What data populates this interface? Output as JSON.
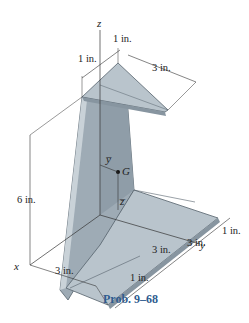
{
  "figure": {
    "caption": "Prob. 9–68",
    "axes": {
      "x": "x",
      "y": "y",
      "z": "z"
    },
    "centroid": {
      "label": "G",
      "ybar": "y̅",
      "zbar": "z̅"
    },
    "dimensions": {
      "top_left": "1 in.",
      "top_right": "1 in.",
      "top_width": "3 in.",
      "height": "6 in.",
      "bottom_x": "3 in.",
      "right_1": "1 in.",
      "right_3a": "3 in.",
      "right_3b": "3 in.",
      "right_1b": "1 in."
    },
    "colors": {
      "face_light": "#b9c4cc",
      "face_mid": "#9eabb5",
      "face_dark": "#8795a0",
      "edge": "#56626c",
      "caption": "#2f5c8f"
    }
  }
}
